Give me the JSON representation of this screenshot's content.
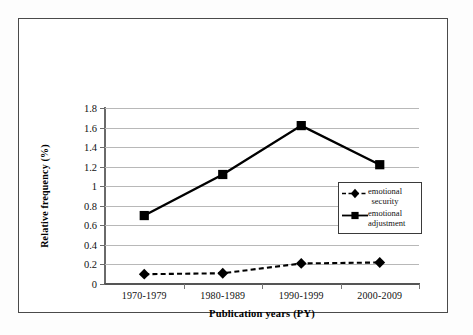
{
  "chart_data": {
    "type": "line",
    "title": "",
    "xlabel": "Publication years (PY)",
    "ylabel": "Relative frequency (%)",
    "categories": [
      "1970-1979",
      "1980-1989",
      "1990-1999",
      "2000-2009"
    ],
    "ylim": [
      0,
      1.8
    ],
    "ytick_labels": [
      "0",
      "0.2",
      "0.4",
      "0.6",
      "0.8",
      "1",
      "1.2",
      "1.4",
      "1.6",
      "1.8"
    ],
    "ytick_values": [
      0,
      0.2,
      0.4,
      0.6,
      0.8,
      1.0,
      1.2,
      1.4,
      1.6,
      1.8
    ],
    "grid": true,
    "legend_position": "center-right-inside",
    "series": [
      {
        "name": "emotional security",
        "name_line1": "emotional",
        "name_line2": "security",
        "values": [
          0.1,
          0.11,
          0.21,
          0.22
        ],
        "marker": "diamond",
        "linestyle": "dashed",
        "color": "#000000"
      },
      {
        "name": "emotional adjustment",
        "name_line1": "emotional",
        "name_line2": "adjustment",
        "values": [
          0.7,
          1.12,
          1.62,
          1.22
        ],
        "marker": "square",
        "linestyle": "solid",
        "color": "#000000"
      }
    ]
  },
  "legend": {
    "entries": [
      {
        "label_line1": "emotional",
        "label_line2": "security"
      },
      {
        "label_line1": "emotional",
        "label_line2": "adjustment"
      }
    ]
  },
  "axes": {
    "x_title": "Publication years (PY)",
    "y_title": "Relative frequency (%)"
  }
}
